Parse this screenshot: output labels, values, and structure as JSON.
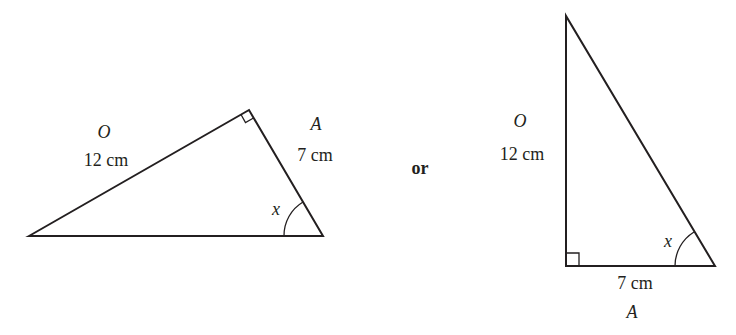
{
  "figure": {
    "connector_word": "or",
    "left_triangle": {
      "opposite_symbol": "O",
      "opposite_length": "12 cm",
      "adjacent_symbol": "A",
      "adjacent_length": "7 cm",
      "angle_label": "x",
      "right_angle_marker": true
    },
    "right_triangle": {
      "opposite_symbol": "O",
      "opposite_length": "12 cm",
      "adjacent_symbol": "A",
      "adjacent_length": "7 cm",
      "angle_label": "x",
      "right_angle_marker": true
    }
  },
  "colors": {
    "line": "#231f20",
    "background": "#ffffff"
  }
}
